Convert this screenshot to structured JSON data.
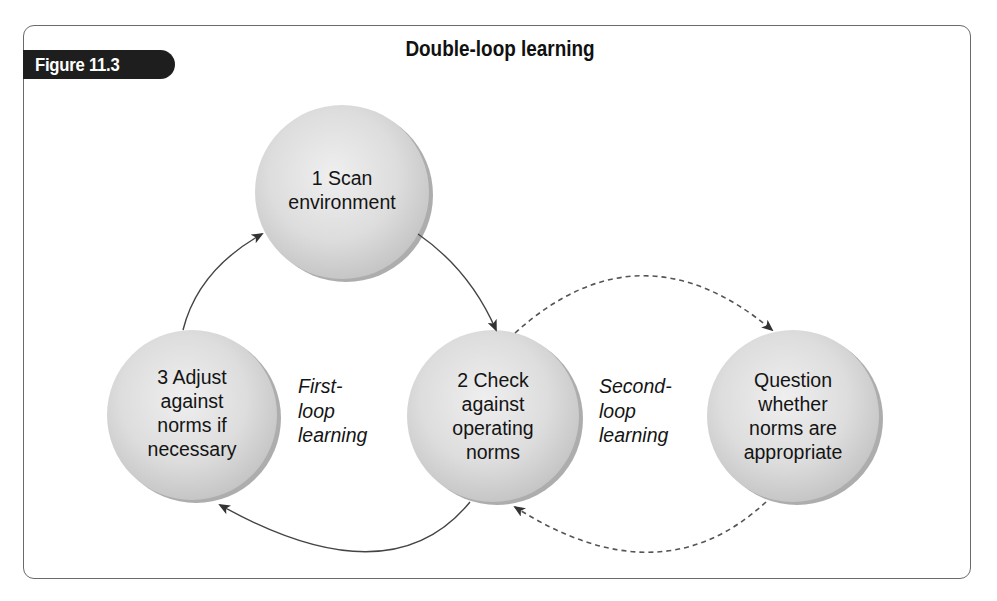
{
  "figure": {
    "label": "Figure 11.3",
    "title": "Double-loop learning"
  },
  "nodes": [
    {
      "id": "scan",
      "text": "1 Scan environment",
      "lines": [
        "1 Scan",
        "environment"
      ],
      "cx": 342,
      "cy": 192,
      "r": 87
    },
    {
      "id": "check",
      "text": "2 Check against operating norms",
      "lines": [
        "2 Check",
        "against",
        "operating",
        "norms"
      ],
      "cx": 493,
      "cy": 416,
      "r": 86
    },
    {
      "id": "adjust",
      "text": "3 Adjust against norms if necessary",
      "lines": [
        "3 Adjust",
        "against",
        "norms if",
        "necessary"
      ],
      "cx": 192,
      "cy": 415,
      "r": 85
    },
    {
      "id": "question",
      "text": "Question whether norms are appropriate",
      "lines": [
        "Question",
        "whether",
        "norms are",
        "appropriate"
      ],
      "cx": 793,
      "cy": 416,
      "r": 86
    }
  ],
  "loop_labels": {
    "first": {
      "lines": [
        "First-",
        "loop",
        "learning"
      ]
    },
    "second": {
      "lines": [
        "Second-",
        "loop",
        "learning"
      ]
    }
  },
  "edges": [
    {
      "from": "scan",
      "to": "check",
      "style": "solid"
    },
    {
      "from": "check",
      "to": "adjust",
      "style": "solid"
    },
    {
      "from": "adjust",
      "to": "scan",
      "style": "solid"
    },
    {
      "from": "check",
      "to": "question",
      "style": "dashed"
    },
    {
      "from": "question",
      "to": "check",
      "style": "dashed"
    }
  ],
  "colors": {
    "frame": "#6a6a6a",
    "tab_bg": "#1e1e1e",
    "node_fill": "#d9d9d9",
    "node_shadow": "#8a8a8a",
    "arrow": "#444444"
  }
}
